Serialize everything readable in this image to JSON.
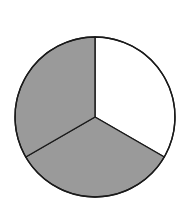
{
  "chart_data": {
    "type": "pie",
    "title": "",
    "categories": [
      "Slice 1",
      "Slice 2",
      "Slice 3"
    ],
    "values": [
      1,
      1,
      1
    ],
    "fractions": [
      "1/3",
      "1/3",
      "1/3"
    ],
    "colors": [
      "#ffffff",
      "#9a9a9a",
      "#9a9a9a"
    ],
    "start_angle_deg_from_top_clockwise": 0,
    "direction": "clockwise",
    "legend": "none",
    "labels": "none",
    "stroke_color": "#1a1a1a"
  }
}
